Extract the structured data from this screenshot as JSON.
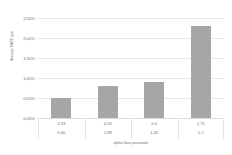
{
  "chart_data": {
    "type": "bar",
    "title": "",
    "xlabel": "alpha/ beta parameter",
    "ylabel": "Average MAPE gap",
    "categories": [
      "3,33",
      "4,05",
      "6,6",
      "1,71"
    ],
    "secondary_categories": [
      "0,40",
      "1,89",
      "1,45",
      "1,7"
    ],
    "values": [
      0.5,
      0.8,
      0.9,
      2.3
    ],
    "value_labels": [
      "0,50%",
      "0,80%",
      "0,90%",
      "2,30%"
    ],
    "ylim": [
      0,
      2.5
    ],
    "ytick_values": [
      2.5,
      2.0,
      1.5,
      1.0,
      0.5,
      0.0
    ],
    "ytick_labels": [
      "2,50%",
      "2,00%",
      "1,50%",
      "1,00%",
      "0,50%",
      "0,00%"
    ],
    "grid": "horizontal",
    "legend": "none",
    "bar_color": "#a6a6a6",
    "gridline_color": "#e8e8e8",
    "text_color": "#757575"
  }
}
